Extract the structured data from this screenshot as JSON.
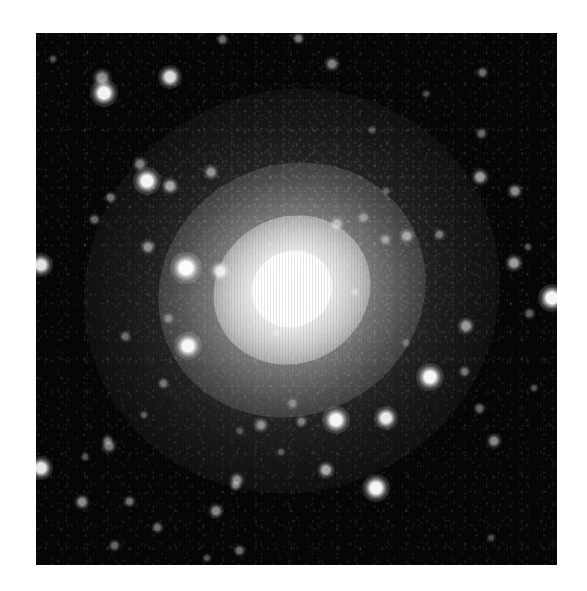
{
  "page": {
    "background_color": "#ffffff",
    "width": 587,
    "height": 591
  },
  "image_frame": {
    "name": "astronomical-exposure",
    "subject": "elliptical galaxy with surrounding globular-cluster / star field",
    "background_color": "#050505",
    "highlight_color": "#ffffff",
    "left": 36,
    "top": 33,
    "width": 521,
    "height": 532,
    "caption": "",
    "scalebar_label": "",
    "axis_labels": []
  },
  "chart_data": {
    "type": "scatter",
    "title": "",
    "xlabel": "",
    "ylabel": "",
    "grid": false,
    "legend": "none",
    "xlim": [
      0,
      521
    ],
    "ylim": [
      0,
      532
    ],
    "note": "Positions are frame-local pixels from the top-left of the dark exposure area; brightness is a 0-1 relative peak intensity; size is the FWHM-like diameter in pixels.",
    "galaxy": {
      "name": "central-elliptical-galaxy",
      "cx": 256,
      "cy": 255,
      "position_angle_deg": -28,
      "core_diameter": 82,
      "bulge_diameter": 160,
      "mid_halo_diameter": 272,
      "outer_halo_diameter": 420,
      "axis_ratio": 0.93,
      "peak_brightness": 1.0
    },
    "stars": [
      {
        "x": 68,
        "y": 60,
        "size": 11,
        "brightness": 0.95
      },
      {
        "x": 66,
        "y": 45,
        "size": 8,
        "brightness": 0.55
      },
      {
        "x": 17,
        "y": 26,
        "size": 4,
        "brightness": 0.3
      },
      {
        "x": 134,
        "y": 44,
        "size": 9,
        "brightness": 0.85
      },
      {
        "x": 186,
        "y": 6,
        "size": 5,
        "brightness": 0.4
      },
      {
        "x": 104,
        "y": 131,
        "size": 6,
        "brightness": 0.45
      },
      {
        "x": 111,
        "y": 148,
        "size": 11,
        "brightness": 0.95
      },
      {
        "x": 134,
        "y": 153,
        "size": 7,
        "brightness": 0.6
      },
      {
        "x": 74,
        "y": 164,
        "size": 5,
        "brightness": 0.42
      },
      {
        "x": 58,
        "y": 186,
        "size": 5,
        "brightness": 0.38
      },
      {
        "x": 112,
        "y": 214,
        "size": 6,
        "brightness": 0.5
      },
      {
        "x": 5,
        "y": 232,
        "size": 9,
        "brightness": 0.88
      },
      {
        "x": 150,
        "y": 235,
        "size": 12,
        "brightness": 0.98
      },
      {
        "x": 184,
        "y": 238,
        "size": 8,
        "brightness": 0.78
      },
      {
        "x": 175,
        "y": 139,
        "size": 6,
        "brightness": 0.52
      },
      {
        "x": 262,
        "y": 5,
        "size": 5,
        "brightness": 0.45
      },
      {
        "x": 296,
        "y": 31,
        "size": 6,
        "brightness": 0.48
      },
      {
        "x": 446,
        "y": 39,
        "size": 5,
        "brightness": 0.4
      },
      {
        "x": 445,
        "y": 100,
        "size": 5,
        "brightness": 0.38
      },
      {
        "x": 444,
        "y": 144,
        "size": 7,
        "brightness": 0.58
      },
      {
        "x": 336,
        "y": 97,
        "size": 4,
        "brightness": 0.3
      },
      {
        "x": 390,
        "y": 61,
        "size": 4,
        "brightness": 0.28
      },
      {
        "x": 479,
        "y": 158,
        "size": 6,
        "brightness": 0.52
      },
      {
        "x": 478,
        "y": 230,
        "size": 7,
        "brightness": 0.6
      },
      {
        "x": 349,
        "y": 206,
        "size": 5,
        "brightness": 0.42
      },
      {
        "x": 371,
        "y": 203,
        "size": 6,
        "brightness": 0.52
      },
      {
        "x": 403,
        "y": 201,
        "size": 5,
        "brightness": 0.4
      },
      {
        "x": 516,
        "y": 265,
        "size": 11,
        "brightness": 0.96
      },
      {
        "x": 327,
        "y": 184,
        "size": 5,
        "brightness": 0.38
      },
      {
        "x": 301,
        "y": 191,
        "size": 6,
        "brightness": 0.5
      },
      {
        "x": 350,
        "y": 158,
        "size": 4,
        "brightness": 0.3
      },
      {
        "x": 319,
        "y": 259,
        "size": 4,
        "brightness": 0.34
      },
      {
        "x": 152,
        "y": 313,
        "size": 11,
        "brightness": 0.95
      },
      {
        "x": 132,
        "y": 285,
        "size": 5,
        "brightness": 0.38
      },
      {
        "x": 73,
        "y": 413,
        "size": 6,
        "brightness": 0.45
      },
      {
        "x": 71,
        "y": 407,
        "size": 5,
        "brightness": 0.35
      },
      {
        "x": 5,
        "y": 435,
        "size": 9,
        "brightness": 0.9
      },
      {
        "x": 127,
        "y": 350,
        "size": 5,
        "brightness": 0.38
      },
      {
        "x": 49,
        "y": 424,
        "size": 4,
        "brightness": 0.3
      },
      {
        "x": 108,
        "y": 382,
        "size": 4,
        "brightness": 0.32
      },
      {
        "x": 93,
        "y": 468,
        "size": 5,
        "brightness": 0.42
      },
      {
        "x": 201,
        "y": 447,
        "size": 6,
        "brightness": 0.48
      },
      {
        "x": 199,
        "y": 452,
        "size": 5,
        "brightness": 0.4
      },
      {
        "x": 180,
        "y": 478,
        "size": 6,
        "brightness": 0.5
      },
      {
        "x": 46,
        "y": 469,
        "size": 6,
        "brightness": 0.52
      },
      {
        "x": 121,
        "y": 494,
        "size": 5,
        "brightness": 0.4
      },
      {
        "x": 203,
        "y": 517,
        "size": 5,
        "brightness": 0.4
      },
      {
        "x": 78,
        "y": 512,
        "size": 5,
        "brightness": 0.38
      },
      {
        "x": 89,
        "y": 303,
        "size": 5,
        "brightness": 0.36
      },
      {
        "x": 225,
        "y": 392,
        "size": 6,
        "brightness": 0.48
      },
      {
        "x": 245,
        "y": 419,
        "size": 4,
        "brightness": 0.3
      },
      {
        "x": 265,
        "y": 388,
        "size": 5,
        "brightness": 0.42
      },
      {
        "x": 350,
        "y": 385,
        "size": 9,
        "brightness": 0.9
      },
      {
        "x": 300,
        "y": 387,
        "size": 11,
        "brightness": 0.95
      },
      {
        "x": 290,
        "y": 437,
        "size": 7,
        "brightness": 0.62
      },
      {
        "x": 340,
        "y": 455,
        "size": 11,
        "brightness": 0.96
      },
      {
        "x": 394,
        "y": 344,
        "size": 11,
        "brightness": 0.96
      },
      {
        "x": 428,
        "y": 338,
        "size": 5,
        "brightness": 0.4
      },
      {
        "x": 443,
        "y": 375,
        "size": 5,
        "brightness": 0.38
      },
      {
        "x": 458,
        "y": 408,
        "size": 6,
        "brightness": 0.5
      },
      {
        "x": 498,
        "y": 355,
        "size": 4,
        "brightness": 0.3
      },
      {
        "x": 256,
        "y": 370,
        "size": 5,
        "brightness": 0.36
      },
      {
        "x": 204,
        "y": 398,
        "size": 4,
        "brightness": 0.28
      },
      {
        "x": 430,
        "y": 293,
        "size": 7,
        "brightness": 0.55
      },
      {
        "x": 370,
        "y": 310,
        "size": 4,
        "brightness": 0.3
      },
      {
        "x": 493,
        "y": 280,
        "size": 5,
        "brightness": 0.35
      },
      {
        "x": 455,
        "y": 505,
        "size": 4,
        "brightness": 0.28
      },
      {
        "x": 171,
        "y": 525,
        "size": 4,
        "brightness": 0.3
      },
      {
        "x": 492,
        "y": 214,
        "size": 4,
        "brightness": 0.3
      },
      {
        "x": 240,
        "y": 300,
        "size": 4,
        "brightness": 0.34
      }
    ]
  }
}
